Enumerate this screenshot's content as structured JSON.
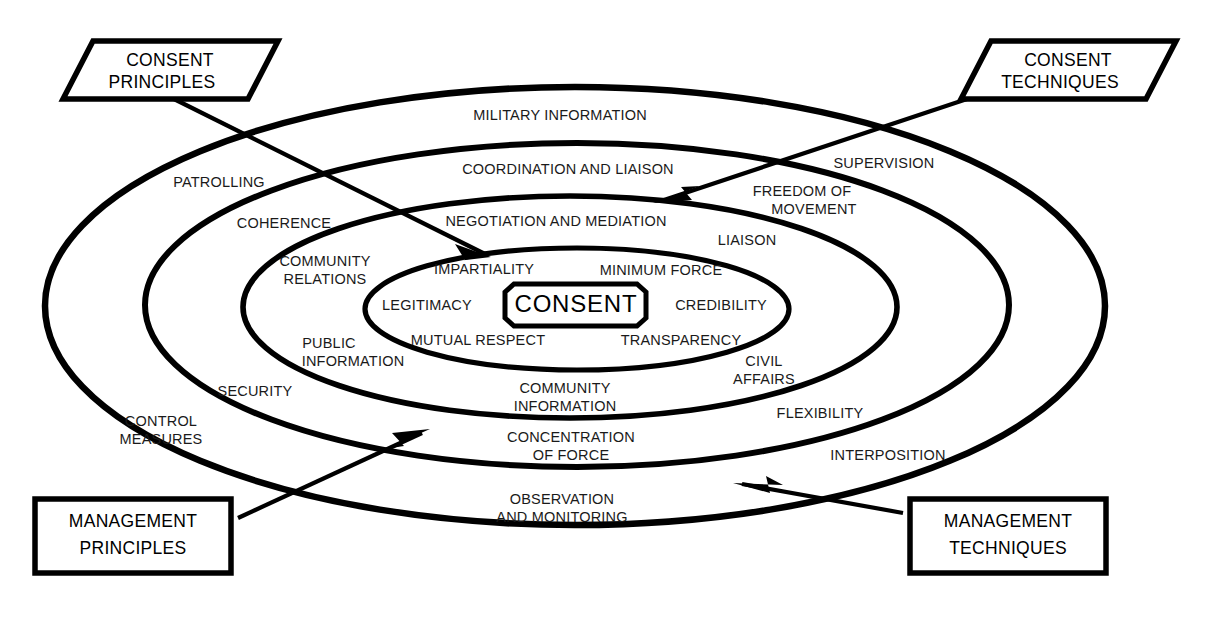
{
  "page": {
    "clipped_caption": "",
    "background_color": "#ffffff",
    "line_color": "#000000"
  },
  "core": {
    "label": "CONSENT"
  },
  "callouts": [
    {
      "id": "consent-principles",
      "line1": "CONSENT",
      "line2": "PRINCIPLES",
      "shape": "parallelogram"
    },
    {
      "id": "consent-techniques",
      "line1": "CONSENT",
      "line2": "TECHNIQUES",
      "shape": "parallelogram"
    },
    {
      "id": "management-principles",
      "line1": "MANAGEMENT",
      "line2": "PRINCIPLES",
      "shape": "rectangle"
    },
    {
      "id": "management-techniques",
      "line1": "MANAGEMENT",
      "line2": "TECHNIQUES",
      "shape": "rectangle"
    }
  ],
  "rings": [
    {
      "id": "ring-1-outer",
      "labels": [
        "MILITARY INFORMATION",
        "SUPERVISION",
        "PATROLLING",
        "CONTROL MEASURES",
        "INTERPOSITION",
        "OBSERVATION AND MONITORING"
      ]
    },
    {
      "id": "ring-2",
      "labels": [
        "COORDINATION AND LIAISON",
        "FREEDOM OF MOVEMENT",
        "COHERENCE",
        "SECURITY",
        "FLEXIBILITY",
        "CONCENTRATION OF FORCE"
      ]
    },
    {
      "id": "ring-3",
      "labels": [
        "NEGOTIATION AND MEDIATION",
        "LIAISON",
        "COMMUNITY RELATIONS",
        "PUBLIC INFORMATION",
        "CIVIL AFFAIRS",
        "COMMUNITY INFORMATION"
      ]
    },
    {
      "id": "ring-4-inner",
      "labels": [
        "IMPARTIALITY",
        "MINIMUM FORCE",
        "LEGITIMACY",
        "CREDIBILITY",
        "MUTUAL RESPECT",
        "TRANSPARENCY"
      ]
    }
  ],
  "ring_labels": {
    "military_information": "MILITARY INFORMATION",
    "supervision": "SUPERVISION",
    "patrolling": "PATROLLING",
    "control_measures_l1": "CONTROL",
    "control_measures_l2": "MEASURES",
    "interposition": "INTERPOSITION",
    "observation_l1": "OBSERVATION",
    "observation_l2": "AND MONITORING",
    "coordination_and_liaison": "COORDINATION AND LIAISON",
    "freedom_l1": "FREEDOM OF",
    "freedom_l2": "MOVEMENT",
    "coherence": "COHERENCE",
    "security": "SECURITY",
    "flexibility": "FLEXIBILITY",
    "concentration_l1": "CONCENTRATION",
    "concentration_l2": "OF FORCE",
    "negotiation_and_mediation": "NEGOTIATION AND MEDIATION",
    "liaison": "LIAISON",
    "community_relations_l1": "COMMUNITY",
    "community_relations_l2": "RELATIONS",
    "public_information_l1": "PUBLIC",
    "public_information_l2": "INFORMATION",
    "civil_affairs_l1": "CIVIL",
    "civil_affairs_l2": "AFFAIRS",
    "community_information_l1": "COMMUNITY",
    "community_information_l2": "INFORMATION",
    "impartiality": "IMPARTIALITY",
    "minimum_force": "MINIMUM FORCE",
    "legitimacy": "LEGITIMACY",
    "credibility": "CREDIBILITY",
    "mutual_respect": "MUTUAL RESPECT",
    "transparency": "TRANSPARENCY"
  },
  "callout_text": {
    "cp_l1": "CONSENT",
    "cp_l2": "PRINCIPLES",
    "ct_l1": "CONSENT",
    "ct_l2": "TECHNIQUES",
    "mp_l1": "MANAGEMENT",
    "mp_l2": "PRINCIPLES",
    "mt_l1": "MANAGEMENT",
    "mt_l2": "TECHNIQUES"
  }
}
